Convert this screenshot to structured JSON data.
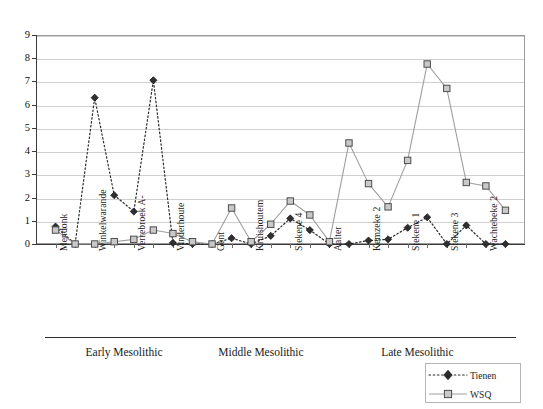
{
  "chart_data": {
    "type": "line",
    "title": "",
    "xlabel": "",
    "ylabel": "",
    "ylim": [
      0,
      9
    ],
    "yticks": [
      0,
      1,
      2,
      3,
      4,
      5,
      6,
      7,
      8,
      9
    ],
    "grid": true,
    "legend_position": "bottom-right",
    "categories": [
      "Mendonk",
      "",
      "Winkelwarande",
      "",
      "Verrebroek A-",
      "",
      "Vinderhoute",
      "",
      "Gent",
      "",
      "Kruishoutem",
      "",
      "Stekene 4",
      "",
      "Aalter",
      "",
      "Kemzeke 2",
      "",
      "Stekene 1",
      "",
      "Stekene 3",
      "",
      "Wachtebeke 2",
      ""
    ],
    "visible_tick_labels": [
      "Mendonk",
      "Winkelwarande",
      "Verrebroek A-",
      "Vinderhoute",
      "Gent",
      "Kruishoutem",
      "Stekene 4",
      "Aalter",
      "Kemzeke 2",
      "Stekene 1",
      "Stekene 3",
      "Wachtebeke 2"
    ],
    "series": [
      {
        "name": "Tienen",
        "marker": "diamond",
        "linestyle": "dotted",
        "color": "#2a2a2a",
        "values": [
          0.75,
          0.0,
          6.3,
          2.1,
          1.4,
          7.05,
          0.05,
          0.0,
          0.0,
          0.25,
          0.0,
          0.35,
          1.1,
          0.6,
          0.0,
          0.0,
          0.15,
          0.2,
          0.7,
          1.15,
          0.0,
          0.8,
          0.0,
          0.0
        ]
      },
      {
        "name": "WSQ",
        "marker": "square",
        "linestyle": "solid",
        "color": "#9e9e9e",
        "values": [
          0.6,
          0.0,
          0.0,
          0.1,
          0.2,
          0.6,
          0.45,
          0.1,
          0.0,
          1.55,
          0.1,
          0.85,
          1.85,
          1.25,
          0.1,
          4.35,
          2.6,
          1.6,
          3.6,
          7.75,
          6.7,
          2.65,
          2.5,
          1.45
        ]
      }
    ],
    "groups": [
      {
        "label": "Early Mesolithic",
        "start_index": 0,
        "end_index": 7
      },
      {
        "label": "Middle Mesolithic",
        "start_index": 8,
        "end_index": 13
      },
      {
        "label": "Late Mesolithic",
        "start_index": 14,
        "end_index": 23
      }
    ]
  },
  "legend": {
    "items": [
      {
        "label": "Tienen"
      },
      {
        "label": "WSQ"
      }
    ]
  }
}
